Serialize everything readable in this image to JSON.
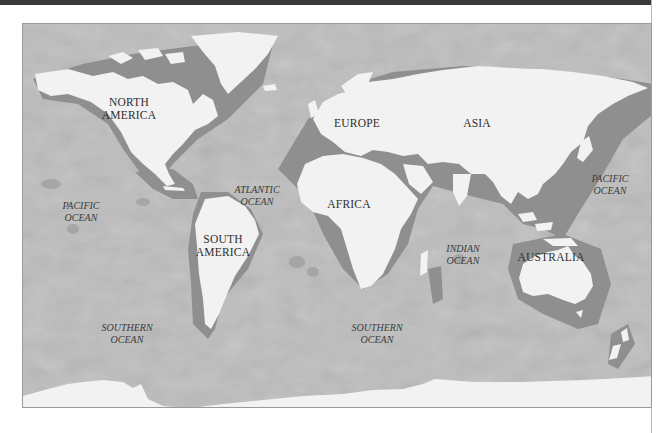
{
  "map": {
    "type": "world-physical-bathymetry",
    "colors": {
      "land": "#f2f2f2",
      "shelf": "#8f8f8f",
      "ocean": "#b5b5b5",
      "deep_ocean": "#a9a9a9",
      "label": "#2e2e2e",
      "topbar": "#3a3a3a"
    },
    "continents": [
      {
        "id": "north-america",
        "lines": [
          "NORTH",
          "AMERICA"
        ],
        "x": 128,
        "y": 95
      },
      {
        "id": "south-america",
        "lines": [
          "SOUTH",
          "AMERICA"
        ],
        "x": 222,
        "y": 232
      },
      {
        "id": "europe",
        "lines": [
          "EUROPE"
        ],
        "x": 356,
        "y": 122
      },
      {
        "id": "asia",
        "lines": [
          "ASIA"
        ],
        "x": 476,
        "y": 122
      },
      {
        "id": "africa",
        "lines": [
          "AFRICA"
        ],
        "x": 348,
        "y": 200
      },
      {
        "id": "australia",
        "lines": [
          "AUSTRALIA"
        ],
        "x": 550,
        "y": 266
      }
    ],
    "oceans": [
      {
        "id": "pacific-ocean-west",
        "lines": [
          "PACIFIC",
          "OCEAN"
        ],
        "x": 80,
        "y": 203
      },
      {
        "id": "atlantic-ocean",
        "lines": [
          "ATLANTIC",
          "OCEAN"
        ],
        "x": 256,
        "y": 188
      },
      {
        "id": "indian-ocean",
        "lines": [
          "INDIAN",
          "OCEAN"
        ],
        "x": 462,
        "y": 241
      },
      {
        "id": "pacific-ocean-east",
        "lines": [
          "PACIFIC",
          "OCEAN"
        ],
        "x": 609,
        "y": 173
      },
      {
        "id": "southern-ocean-west",
        "lines": [
          "SOUTHERN",
          "OCEAN"
        ],
        "x": 126,
        "y": 325
      },
      {
        "id": "southern-ocean-east",
        "lines": [
          "SOUTHERN",
          "OCEAN"
        ],
        "x": 376,
        "y": 325
      }
    ]
  }
}
